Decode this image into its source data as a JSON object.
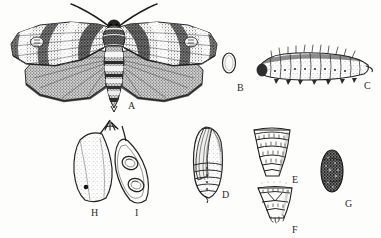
{
  "plate": {
    "kind": "scientific-illustration-plate",
    "subject": "moth life-cycle plate",
    "background_color": "#fdfdfb",
    "ink_color": "#2b2b2b",
    "width": 381,
    "height": 238
  },
  "figures": [
    {
      "key": "A",
      "label": "A",
      "name": "adult-moth",
      "description": "adult moth with wings spread, mottled forewings, plain hindwings, filiform antennae",
      "label_x": 128,
      "label_y": 101,
      "bbox": [
        8,
        2,
        200,
        112
      ]
    },
    {
      "key": "B",
      "label": "B",
      "name": "egg",
      "description": "single oval egg in outline",
      "label_x": 237,
      "label_y": 83,
      "bbox": [
        221,
        52,
        16,
        22
      ]
    },
    {
      "key": "C",
      "label": "C",
      "name": "larva-caterpillar",
      "description": "hairy caterpillar in lateral view curving slightly upward",
      "label_x": 364,
      "label_y": 81,
      "bbox": [
        256,
        50,
        116,
        32
      ]
    },
    {
      "key": "D",
      "label": "D",
      "name": "pupa",
      "description": "pupa in lateral view showing wing cases and segmented abdomen",
      "label_x": 222,
      "label_y": 190,
      "bbox": [
        190,
        126,
        34,
        74
      ]
    },
    {
      "key": "E",
      "label": "E",
      "name": "pupal-abdomen-segments-dorsal",
      "description": "enlarged tapering abdominal segments of pupa, dorsal aspect",
      "label_x": 292,
      "label_y": 175,
      "bbox": [
        252,
        126,
        40,
        50
      ]
    },
    {
      "key": "F",
      "label": "F",
      "name": "pupal-cremaster-detail",
      "description": "enlarged terminal abdominal segments and cremaster of pupa",
      "label_x": 292,
      "label_y": 225,
      "bbox": [
        256,
        185,
        38,
        38
      ]
    },
    {
      "key": "G",
      "label": "G",
      "name": "cocoon",
      "description": "dark stippled ovoid cocoon",
      "label_x": 345,
      "label_y": 199,
      "bbox": [
        321,
        150,
        24,
        44
      ]
    },
    {
      "key": "H",
      "label": "H",
      "name": "damaged-pod-intact",
      "description": "legume pod in outline with stippled interior and entry hole",
      "label_x": 91,
      "label_y": 208,
      "bbox": [
        70,
        128,
        45,
        75
      ]
    },
    {
      "key": "I",
      "label": "I",
      "name": "damaged-pod-opened",
      "description": "legume pod opened showing two damaged seeds inside",
      "label_x": 135,
      "label_y": 208,
      "bbox": [
        113,
        140,
        40,
        65
      ]
    }
  ]
}
